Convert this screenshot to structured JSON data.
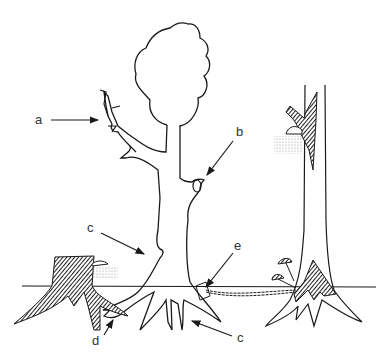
{
  "diagram": {
    "labels": {
      "a": "a",
      "b": "b",
      "c1": "c",
      "c2": "c",
      "d": "d",
      "e": "e"
    },
    "colors": {
      "ink": "#1a1a1a",
      "label": "#333333",
      "background": "#ffffff",
      "hatch": "#2a2a2a"
    }
  }
}
